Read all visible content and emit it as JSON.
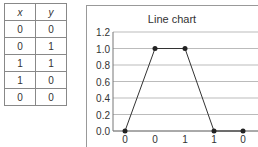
{
  "table": {
    "headers": [
      "x",
      "y"
    ],
    "rows": [
      [
        "0",
        "0"
      ],
      [
        "0",
        "1"
      ],
      [
        "1",
        "1"
      ],
      [
        "1",
        "0"
      ],
      [
        "0",
        "0"
      ]
    ]
  },
  "chart_data": {
    "type": "line",
    "title": "Line chart",
    "categories": [
      "0",
      "0",
      "1",
      "1",
      "0"
    ],
    "values": [
      0,
      1,
      1,
      0,
      0
    ],
    "xlabel": "",
    "ylabel": "",
    "ylim": [
      0,
      1.2
    ],
    "yticks": [
      "0.0",
      "0.2",
      "0.4",
      "0.6",
      "0.8",
      "1.0",
      "1.2"
    ],
    "grid": true,
    "legend": false
  }
}
